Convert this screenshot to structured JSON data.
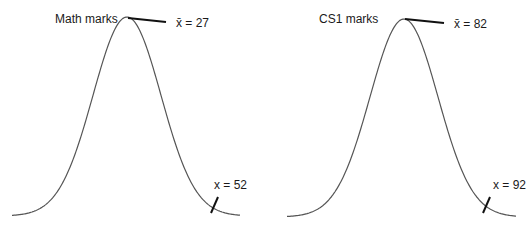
{
  "chart_data": [
    {
      "type": "line",
      "title": "Math marks",
      "distribution": "normal",
      "mean": 27,
      "annotations": [
        {
          "label": "x̄ = 27",
          "symbol": "x̄",
          "value": 27,
          "position": "peak"
        },
        {
          "label": "x = 52",
          "symbol": "x",
          "value": 52,
          "position": "right-tail"
        }
      ],
      "xlabel": "",
      "ylabel": "",
      "grid": false,
      "axes": false
    },
    {
      "type": "line",
      "title": "CS1 marks",
      "distribution": "normal",
      "mean": 82,
      "annotations": [
        {
          "label": "x̄ = 82",
          "symbol": "x̄",
          "value": 82,
          "position": "peak"
        },
        {
          "label": "x = 92",
          "symbol": "x",
          "value": 92,
          "position": "right-tail"
        }
      ],
      "xlabel": "",
      "ylabel": "",
      "grid": false,
      "axes": false
    }
  ],
  "panels": [
    {
      "title": "Math marks",
      "mean_sym": "x̄",
      "mean_text": " = 27",
      "point_sym": "x",
      "point_text": " = 52"
    },
    {
      "title": "CS1 marks",
      "mean_sym": "x̄",
      "mean_text": " = 82",
      "point_sym": "x",
      "point_text": " = 92"
    }
  ],
  "colors": {
    "curve": "#555555",
    "pointer": "#111111",
    "text": "#1a1a1a"
  }
}
